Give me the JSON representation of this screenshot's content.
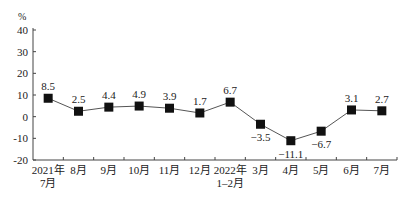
{
  "chart_data": {
    "type": "line",
    "title": "",
    "unit_label": "%",
    "xlabel": "",
    "ylabel": "%",
    "ylim": [
      -20,
      40
    ],
    "yticks": [
      40,
      30,
      20,
      10,
      0,
      -10,
      -20
    ],
    "ytick_labels": [
      "40",
      "30",
      "20",
      "10",
      "0",
      "-10",
      "-20"
    ],
    "grid": false,
    "legend": "none",
    "categories": [
      [
        "2021年",
        "7月"
      ],
      [
        "8月"
      ],
      [
        "9月"
      ],
      [
        "10月"
      ],
      [
        "11月"
      ],
      [
        "12月"
      ],
      [
        "2022年",
        "1–2月"
      ],
      [
        "3月"
      ],
      [
        "4月"
      ],
      [
        "5月"
      ],
      [
        "6月"
      ],
      [
        "7月"
      ]
    ],
    "series": [
      {
        "name": "growth",
        "values": [
          8.5,
          2.5,
          4.4,
          4.9,
          3.9,
          1.7,
          6.7,
          -3.5,
          -11.1,
          -6.7,
          3.1,
          2.7
        ],
        "labels": [
          "8.5",
          "2.5",
          "4.4",
          "4.9",
          "3.9",
          "1.7",
          "6.7",
          "−3.5",
          "−11.1",
          "−6.7",
          "3.1",
          "2.7"
        ],
        "label_positions": [
          "above",
          "above",
          "above",
          "above",
          "above",
          "above",
          "above",
          "below",
          "below",
          "below",
          "above",
          "above"
        ],
        "color": "#111111",
        "marker": "square"
      }
    ]
  }
}
